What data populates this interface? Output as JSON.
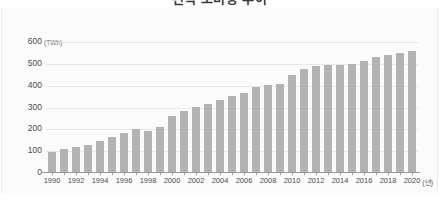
{
  "title": "전력 소비량 추이",
  "axis": {
    "y_unit": "(TWh)",
    "x_unit": "(년)",
    "y_ticks": [
      "600",
      "500",
      "400",
      "300",
      "200",
      "100",
      "0"
    ],
    "x_ticks": [
      "1990",
      "1992",
      "1994",
      "1996",
      "1998",
      "2000",
      "2002",
      "2004",
      "2006",
      "2008",
      "2010",
      "2012",
      "2014",
      "2016",
      "2018",
      "2020"
    ]
  },
  "colors": {
    "bar": "#b3b3b3",
    "grid": "#e6e6e6",
    "axis": "#9a9a9a",
    "panel": "#fbfbfb",
    "text": "#4a4a4a"
  },
  "chart_data": {
    "type": "bar",
    "title": "전력 소비량 추이",
    "xlabel": "(년)",
    "ylabel": "(TWh)",
    "ylim": [
      0,
      600
    ],
    "grid": true,
    "legend": "none",
    "categories": [
      "1990",
      "1991",
      "1992",
      "1993",
      "1994",
      "1995",
      "1996",
      "1997",
      "1998",
      "1999",
      "2000",
      "2001",
      "2002",
      "2003",
      "2004",
      "2005",
      "2006",
      "2007",
      "2008",
      "2009",
      "2010",
      "2011",
      "2012",
      "2013",
      "2014",
      "2015",
      "2016",
      "2017",
      "2018",
      "2019",
      "2020"
    ],
    "values": [
      90,
      104,
      113,
      122,
      143,
      162,
      179,
      197,
      188,
      207,
      258,
      279,
      297,
      312,
      330,
      350,
      364,
      388,
      398,
      405,
      445,
      472,
      487,
      491,
      492,
      496,
      510,
      529,
      537,
      545,
      554
    ],
    "tick_categories": [
      "1990",
      "1992",
      "1994",
      "1996",
      "1998",
      "2000",
      "2002",
      "2004",
      "2006",
      "2008",
      "2010",
      "2012",
      "2014",
      "2016",
      "2018",
      "2020"
    ]
  }
}
